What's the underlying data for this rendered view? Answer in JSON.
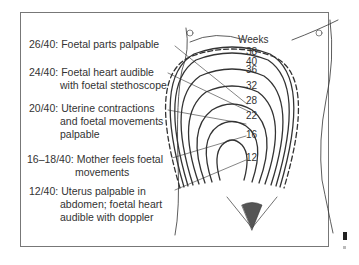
{
  "diagram": {
    "weeks_title": "Weeks",
    "week_marks": [
      "38",
      "40",
      "36",
      "32",
      "28",
      "22",
      "16",
      "12"
    ],
    "annotations": [
      {
        "gest": "26/40:",
        "lines": [
          "Foetal parts palpable"
        ]
      },
      {
        "gest": "24/40:",
        "lines": [
          "Foetal heart audible",
          "with foetal stethoscope"
        ]
      },
      {
        "gest": "20/40:",
        "lines": [
          "Uterine contractions",
          "and foetal movements",
          "palpable"
        ]
      },
      {
        "gest": "16–18/40:",
        "lines": [
          "Mother feels foetal",
          "movements"
        ]
      },
      {
        "gest": "12/40:",
        "lines": [
          "Uterus palpable in",
          "abdomen; foetal heart",
          "audible with doppler"
        ]
      }
    ]
  }
}
